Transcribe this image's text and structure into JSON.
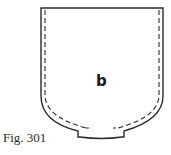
{
  "figure": {
    "piece_label": "b",
    "caption": "Fig. 301",
    "line_color": "#2a2a2a",
    "background": "#ffffff"
  }
}
